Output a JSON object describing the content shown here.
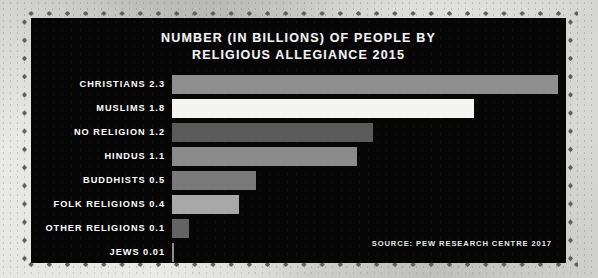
{
  "poster": {
    "frame_style": "dotted-perforated-border",
    "paper_color": "#cccccA",
    "panel_color": "#060606"
  },
  "chart_data": {
    "type": "bar",
    "orientation": "horizontal",
    "title": "NUMBER (IN BILLIONS) OF PEOPLE BY RELIGIOUS ALLEGIANCE 2015",
    "title_line1": "NUMBER (IN BILLIONS) OF PEOPLE BY",
    "title_line2": "RELIGIOUS ALLEGIANCE 2015",
    "xlabel": "",
    "ylabel": "",
    "unit": "billions of people",
    "year": "2015",
    "grid": false,
    "legend": false,
    "xlim": [
      0,
      2.3
    ],
    "categories": [
      "CHRISTIANS",
      "MUSLIMS",
      "NO RELIGION",
      "HINDUS",
      "BUDDHISTS",
      "FOLK RELIGIONS",
      "OTHER RELIGIONS",
      "JEWS"
    ],
    "values": [
      2.3,
      1.8,
      1.2,
      1.1,
      0.5,
      0.4,
      0.1,
      0.01
    ],
    "bar_colors": [
      "#8f8f8f",
      "#f4f4f2",
      "#5a5a5a",
      "#8b8b8b",
      "#7a7a7a",
      "#a8a8a8",
      "#636363",
      "#8a8a8a"
    ],
    "source": "SOURCE: PEW RESEARCH CENTRE 2017",
    "rows": [
      {
        "label": "CHRISTIANS 2.3",
        "category": "CHRISTIANS",
        "value": 2.3,
        "value_text": "2.3",
        "color": "#8f8f8f"
      },
      {
        "label": "MUSLIMS 1.8",
        "category": "MUSLIMS",
        "value": 1.8,
        "value_text": "1.8",
        "color": "#f4f4f2"
      },
      {
        "label": "NO RELIGION 1.2",
        "category": "NO RELIGION",
        "value": 1.2,
        "value_text": "1.2",
        "color": "#5a5a5a"
      },
      {
        "label": "HINDUS 1.1",
        "category": "HINDUS",
        "value": 1.1,
        "value_text": "1.1",
        "color": "#8b8b8b"
      },
      {
        "label": "BUDDHISTS 0.5",
        "category": "BUDDHISTS",
        "value": 0.5,
        "value_text": "0.5",
        "color": "#7a7a7a"
      },
      {
        "label": "FOLK RELIGIONS 0.4",
        "category": "FOLK RELIGIONS",
        "value": 0.4,
        "value_text": "0.4",
        "color": "#a8a8a8"
      },
      {
        "label": "OTHER RELIGIONS 0.1",
        "category": "OTHER RELIGIONS",
        "value": 0.1,
        "value_text": "0.1",
        "color": "#636363"
      },
      {
        "label": "JEWS 0.01",
        "category": "JEWS",
        "value": 0.01,
        "value_text": "0.01",
        "color": "#8a8a8a"
      }
    ]
  }
}
